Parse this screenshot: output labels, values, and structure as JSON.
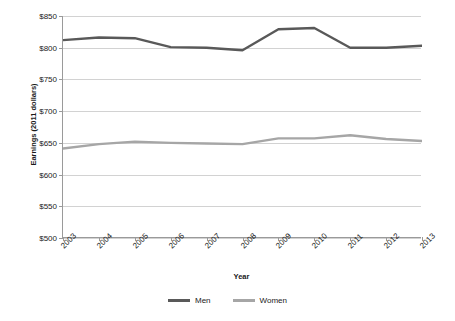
{
  "chart_data": {
    "type": "line",
    "title": "",
    "xlabel": "Year",
    "ylabel": "Earnings (2011 dollars)",
    "categories": [
      "2003",
      "2004",
      "2005",
      "2006",
      "2007",
      "2008",
      "2009",
      "2010",
      "2011",
      "2012",
      "2013"
    ],
    "ylim": [
      500,
      850
    ],
    "yticks": [
      "$500",
      "$550",
      "$600",
      "$650",
      "$700",
      "$750",
      "$800",
      "$850"
    ],
    "ytick_values": [
      500,
      550,
      600,
      650,
      700,
      750,
      800,
      850
    ],
    "grid": true,
    "legend_position": "bottom",
    "series": [
      {
        "name": "Men",
        "color": "#595959",
        "values": [
          812,
          816,
          815,
          801,
          800,
          796,
          829,
          831,
          800,
          800,
          803
        ]
      },
      {
        "name": "Women",
        "color": "#a6a6a6",
        "values": [
          641,
          648,
          652,
          650,
          649,
          648,
          657,
          657,
          662,
          656,
          653
        ]
      }
    ]
  },
  "legend": {
    "items": [
      {
        "label": "Men",
        "color": "#595959"
      },
      {
        "label": "Women",
        "color": "#a6a6a6"
      }
    ]
  }
}
